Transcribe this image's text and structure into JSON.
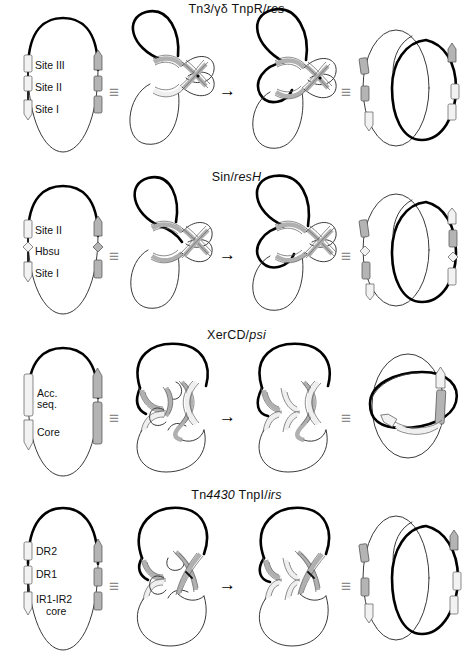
{
  "figure": {
    "symbols": {
      "equivalence": "≡",
      "reaction_arrow": "→"
    },
    "colors": {
      "dna_strand_dark": "#000000",
      "dna_strand_light": "#3a3a3a",
      "site_fill_gray": "#b4b4b4",
      "site_fill_light": "#f2f2f2",
      "site_outline": "#4a4a4a",
      "background": "#ffffff"
    },
    "columns": [
      {
        "name": "substrate",
        "description": "circular DNA substrate with recombination sites"
      },
      {
        "name": "synaptic-complex",
        "description": "pre-recombination synapse"
      },
      {
        "name": "post-recombination-complex",
        "description": "complex after strand exchange"
      },
      {
        "name": "product-topology",
        "description": "product catenane or knot"
      }
    ],
    "rows": [
      {
        "id": "tn3",
        "title_parts": [
          {
            "text": "Tn3/γδ TnpR/",
            "italic": false
          },
          {
            "text": "res",
            "italic": true
          }
        ],
        "title_plain": "Tn3/γδ TnpR/res",
        "site_labels": [
          "Site III",
          "Site II",
          "Site I"
        ],
        "product": "2-crossing catenane"
      },
      {
        "id": "sin",
        "title_parts": [
          {
            "text": "Sin/",
            "italic": false
          },
          {
            "text": "resH",
            "italic": true
          }
        ],
        "title_plain": "Sin/resH",
        "site_labels": [
          "Site II",
          "Hbsu",
          "Site I"
        ],
        "product": "2-crossing catenane"
      },
      {
        "id": "xercd",
        "title_parts": [
          {
            "text": "XerCD/",
            "italic": false
          },
          {
            "text": "psi",
            "italic": true
          }
        ],
        "title_plain": "XerCD/psi",
        "site_labels": [
          "Acc.",
          "seq.",
          "Core"
        ],
        "product": "3-crossing catenane / knot"
      },
      {
        "id": "tn4430",
        "title_parts": [
          {
            "text": "Tn",
            "italic": false
          },
          {
            "text": "4430",
            "italic": true
          },
          {
            "text": " TnpI/",
            "italic": false
          },
          {
            "text": "irs",
            "italic": true
          }
        ],
        "title_plain": "Tn4430 TnpI/irs",
        "site_labels": [
          "DR2",
          "DR1",
          "IR1-IR2",
          "core"
        ],
        "product": "2-crossing catenane"
      }
    ]
  }
}
